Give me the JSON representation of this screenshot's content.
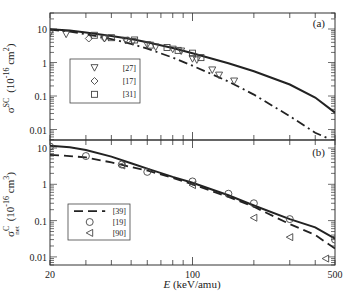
{
  "chart_data": [
    {
      "type": "line",
      "panel_label": "(a)",
      "ylabel_main": "σ",
      "ylabel_sup": "SC",
      "ylabel_units": "(10",
      "ylabel_units_exp": "-16",
      "ylabel_units_tail": " cm",
      "ylabel_units_tail_exp": "2",
      "ylabel_close": ")",
      "xscale": "log",
      "yscale": "log",
      "xlim": [
        20,
        500
      ],
      "ylim": [
        0.005,
        30
      ],
      "yticks": [
        {
          "value": 10,
          "label": "10"
        },
        {
          "value": 1,
          "label": "1"
        },
        {
          "value": 0.1,
          "label": "0.1"
        },
        {
          "value": 0.01,
          "label": "0.01"
        }
      ],
      "series": [
        {
          "name": "theory-solid",
          "style": "solid",
          "x": [
            20,
            25,
            30,
            40,
            50,
            60,
            80,
            100,
            150,
            200,
            300,
            400,
            500
          ],
          "y": [
            9.8,
            9.0,
            7.9,
            6.2,
            5.0,
            4.0,
            2.7,
            1.9,
            0.95,
            0.55,
            0.22,
            0.09,
            0.032
          ]
        },
        {
          "name": "theory-dashdot",
          "style": "dashdot",
          "x": [
            20,
            25,
            30,
            40,
            50,
            60,
            80,
            100,
            150,
            200,
            300,
            400,
            460
          ],
          "y": [
            9.5,
            8.3,
            7.0,
            5.0,
            3.6,
            2.6,
            1.4,
            0.8,
            0.27,
            0.11,
            0.025,
            0.008,
            0.0055
          ]
        },
        {
          "name": "[27]",
          "marker": "triangle-down",
          "x": [
            20,
            24,
            37,
            47,
            51,
            60,
            66,
            80,
            88,
            100,
            105,
            125,
            135,
            160
          ],
          "y": [
            7.5,
            7.0,
            5.2,
            4.6,
            4.2,
            3.4,
            2.9,
            2.5,
            2.2,
            1.3,
            1.2,
            0.6,
            0.42,
            0.28
          ]
        },
        {
          "name": "[17]",
          "marker": "diamond",
          "x": [
            31,
            37,
            48
          ],
          "y": [
            5.2,
            5.3,
            4.6
          ]
        },
        {
          "name": "[31]",
          "marker": "square",
          "x": [
            33,
            40,
            52,
            62,
            75,
            85,
            100,
            110
          ],
          "y": [
            6.5,
            5.5,
            4.7,
            3.3,
            2.8,
            2.3,
            1.9,
            1.4
          ]
        }
      ],
      "legend": [
        {
          "marker": "triangle-down",
          "label": "[27]"
        },
        {
          "marker": "diamond",
          "label": "[17]"
        },
        {
          "marker": "square",
          "label": "[31]"
        }
      ]
    },
    {
      "type": "line",
      "panel_label": "(b)",
      "ylabel_main": "σ",
      "ylabel_sup": "C",
      "ylabel_sub": "net",
      "ylabel_units": "(10",
      "ylabel_units_exp": "-16",
      "ylabel_units_tail": " cm",
      "ylabel_units_tail_exp": "3",
      "ylabel_close": ")",
      "xlabel": "E (keV/amu)",
      "xlabel_italic": "E",
      "xlabel_rest": " (keV/amu)",
      "xscale": "log",
      "yscale": "log",
      "xlim": [
        20,
        500
      ],
      "ylim": [
        0.006,
        17
      ],
      "xticks": [
        {
          "value": 20,
          "label": "20"
        },
        {
          "value": 100,
          "label": "100"
        },
        {
          "value": 500,
          "label": "500"
        }
      ],
      "yticks": [
        {
          "value": 10,
          "label": "10"
        },
        {
          "value": 1,
          "label": "1"
        },
        {
          "value": 0.1,
          "label": "0.1"
        },
        {
          "value": 0.01,
          "label": "0.01"
        }
      ],
      "series": [
        {
          "name": "theory-solid",
          "style": "solid",
          "x": [
            20,
            25,
            30,
            40,
            50,
            60,
            80,
            100,
            150,
            200,
            300,
            400,
            500
          ],
          "y": [
            11.5,
            10.5,
            8.8,
            5.8,
            3.8,
            2.7,
            1.6,
            1.1,
            0.5,
            0.26,
            0.11,
            0.065,
            0.032
          ]
        },
        {
          "name": "[39]",
          "style": "dashed",
          "x": [
            20,
            25,
            30,
            40,
            50,
            60,
            80,
            100,
            150,
            200,
            300,
            400,
            500
          ],
          "y": [
            6.5,
            6.0,
            5.5,
            4.0,
            3.0,
            2.4,
            1.5,
            1.0,
            0.45,
            0.24,
            0.08,
            0.04,
            0.017
          ]
        },
        {
          "name": "[19]",
          "marker": "circle",
          "x": [
            20,
            30,
            45,
            60,
            100,
            150,
            200,
            300,
            500
          ],
          "y": [
            11,
            6.0,
            3.5,
            2.2,
            1.2,
            0.55,
            0.3,
            0.11,
            0.03
          ]
        },
        {
          "name": "[90]",
          "marker": "triangle-left",
          "x": [
            45,
            100,
            200,
            300,
            450
          ],
          "y": [
            3.3,
            0.95,
            0.12,
            0.035,
            0.009
          ]
        }
      ],
      "legend": [
        {
          "line": "dashed",
          "label": "[39]"
        },
        {
          "marker": "circle",
          "label": "[19]"
        },
        {
          "marker": "triangle-left",
          "label": "[90]"
        }
      ]
    }
  ]
}
